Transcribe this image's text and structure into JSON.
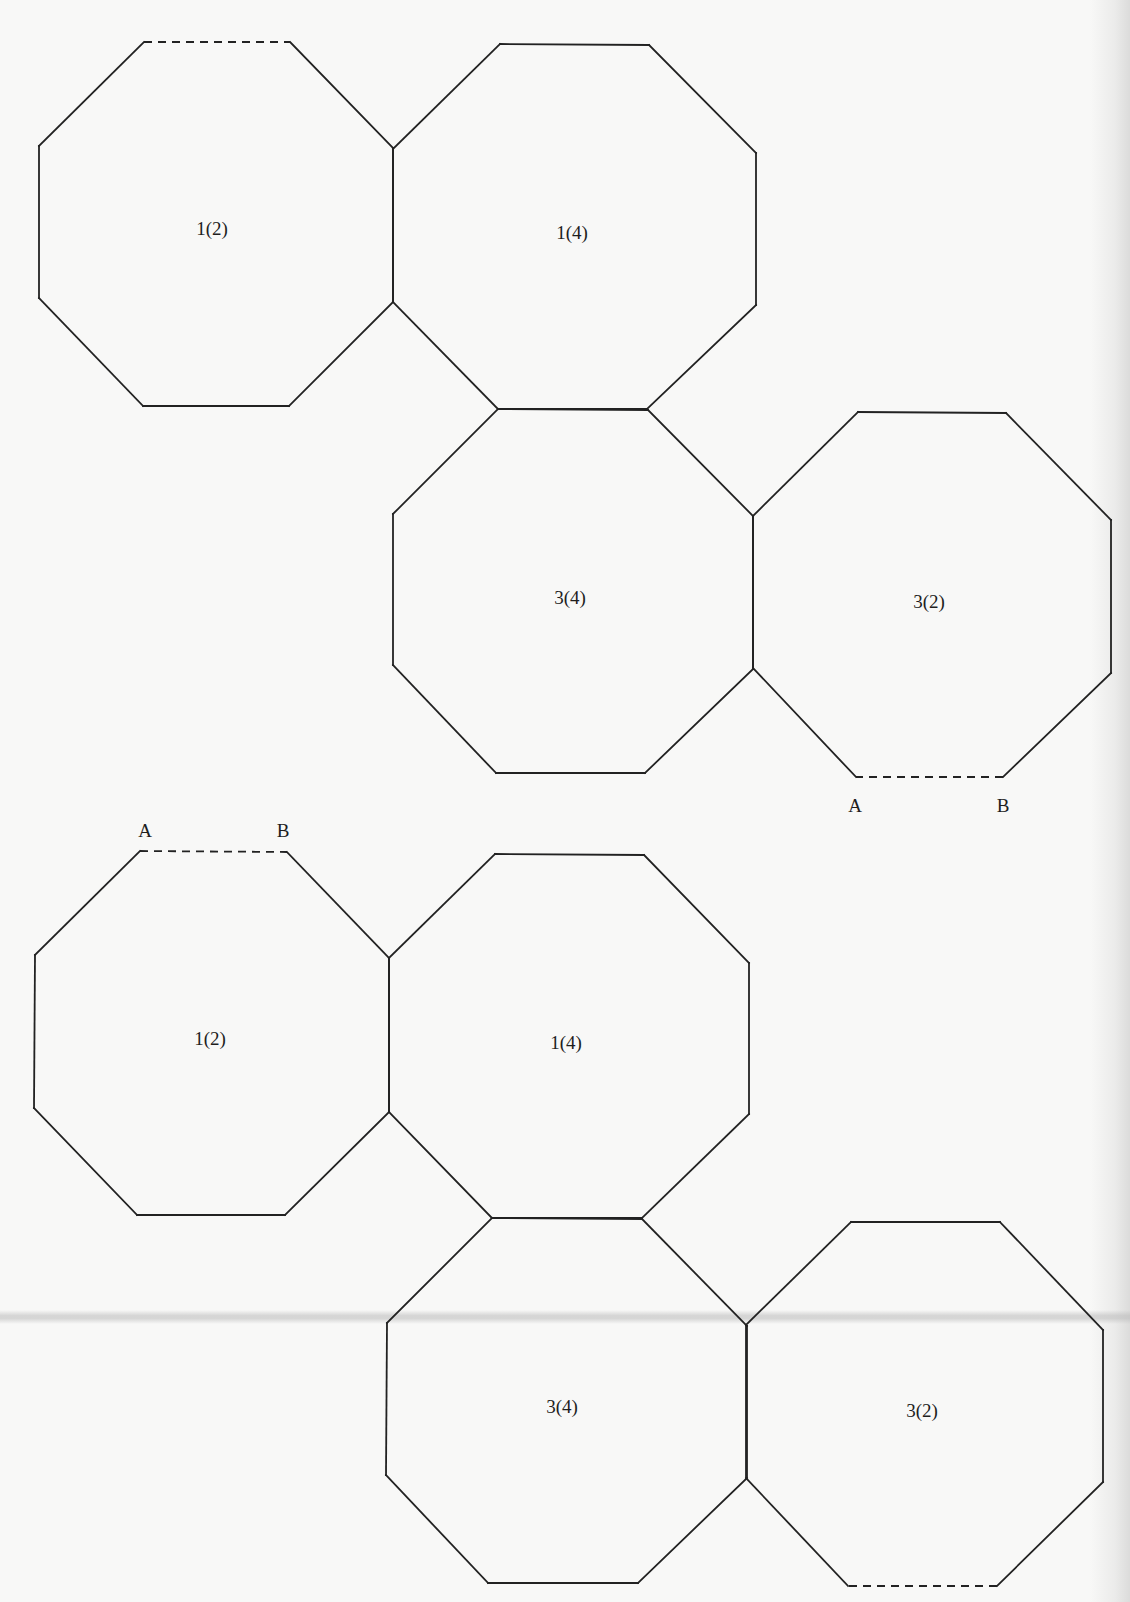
{
  "figure": {
    "colors": {
      "line": "#222222",
      "background": "#f8f8f7",
      "text": "#1e1e1e"
    },
    "nets": [
      {
        "id": "net-top",
        "octagons": [
          {
            "label": "1(2)",
            "label_pos": [
              212,
              228
            ],
            "vertices": [
              [
                144,
                42
              ],
              [
                290,
                42
              ],
              [
                393,
                148
              ],
              [
                393,
                302
              ],
              [
                289,
                406
              ],
              [
                143,
                406
              ],
              [
                39,
                298
              ],
              [
                39,
                146
              ]
            ],
            "dashed_edge": [
              0,
              1
            ]
          },
          {
            "label": "1(4)",
            "label_pos": [
              572,
              232
            ],
            "vertices": [
              [
                500,
                44
              ],
              [
                649,
                45
              ],
              [
                756,
                153
              ],
              [
                756,
                305
              ],
              [
                647,
                409
              ],
              [
                498,
                409
              ],
              [
                393,
                302
              ],
              [
                393,
                149
              ]
            ],
            "dashed_edge": null
          },
          {
            "label": "3(4)",
            "label_pos": [
              570,
              597
            ],
            "vertices": [
              [
                498,
                409
              ],
              [
                648,
                410
              ],
              [
                753,
                516
              ],
              [
                753,
                669
              ],
              [
                645,
                773
              ],
              [
                496,
                773
              ],
              [
                393,
                665
              ],
              [
                393,
                514
              ]
            ],
            "dashed_edge": null
          },
          {
            "label": "3(2)",
            "label_pos": [
              929,
              601
            ],
            "vertices": [
              [
                858,
                412
              ],
              [
                1006,
                413
              ],
              [
                1111,
                520
              ],
              [
                1111,
                673
              ],
              [
                1003,
                777
              ],
              [
                856,
                777
              ],
              [
                753,
                668
              ],
              [
                753,
                516
              ]
            ],
            "dashed_edge": [
              4,
              5
            ]
          }
        ],
        "vertex_labels": [
          {
            "text": "A",
            "pos": [
              855,
              805
            ]
          },
          {
            "text": "B",
            "pos": [
              1003,
              805
            ]
          }
        ]
      },
      {
        "id": "net-bottom",
        "octagons": [
          {
            "label": "1(2)",
            "label_pos": [
              210,
              1038
            ],
            "vertices": [
              [
                140,
                851
              ],
              [
                287,
                852
              ],
              [
                389,
                958
              ],
              [
                389,
                1112
              ],
              [
                285,
                1215
              ],
              [
                137,
                1215
              ],
              [
                34,
                1108
              ],
              [
                35,
                955
              ]
            ],
            "dashed_edge": [
              0,
              1
            ]
          },
          {
            "label": "1(4)",
            "label_pos": [
              566,
              1042
            ],
            "vertices": [
              [
                495,
                854
              ],
              [
                644,
                855
              ],
              [
                749,
                963
              ],
              [
                749,
                1114
              ],
              [
                642,
                1218
              ],
              [
                492,
                1218
              ],
              [
                389,
                1112
              ],
              [
                389,
                958
              ]
            ],
            "dashed_edge": null
          },
          {
            "label": "3(4)",
            "label_pos": [
              562,
              1406
            ],
            "vertices": [
              [
                492,
                1218
              ],
              [
                642,
                1219
              ],
              [
                747,
                1326
              ],
              [
                747,
                1478
              ],
              [
                638,
                1583
              ],
              [
                488,
                1583
              ],
              [
                386,
                1475
              ],
              [
                387,
                1323
              ]
            ],
            "dashed_edge": null
          },
          {
            "label": "3(2)",
            "label_pos": [
              922,
              1410
            ],
            "vertices": [
              [
                851,
                1222
              ],
              [
                1000,
                1222
              ],
              [
                1103,
                1330
              ],
              [
                1103,
                1482
              ],
              [
                997,
                1586
              ],
              [
                848,
                1586
              ],
              [
                746,
                1478
              ],
              [
                746,
                1325
              ]
            ],
            "dashed_edge": [
              4,
              5
            ]
          }
        ],
        "vertex_labels": [
          {
            "text": "A",
            "pos": [
              145,
              830
            ]
          },
          {
            "text": "B",
            "pos": [
              283,
              830
            ]
          }
        ]
      }
    ]
  },
  "labels": {
    "top_1_2": "1(2)",
    "top_1_4": "1(4)",
    "top_3_4": "3(4)",
    "top_3_2": "3(2)",
    "top_A": "A",
    "top_B": "B",
    "bottom_1_2": "1(2)",
    "bottom_1_4": "1(4)",
    "bottom_3_4": "3(4)",
    "bottom_3_2": "3(2)",
    "bottom_A": "A",
    "bottom_B": "B"
  }
}
